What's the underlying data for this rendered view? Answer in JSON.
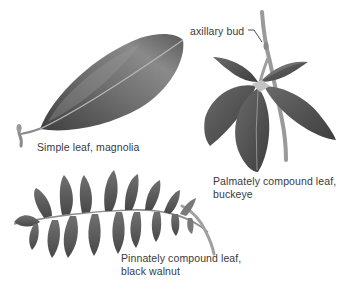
{
  "figure": {
    "background_color": "#ffffff",
    "leaf_color_dark": "#4a4a4a",
    "leaf_color_mid": "#7a7a7a",
    "leaf_color_light": "#a8a8a8",
    "text_color": "#3a3a3a",
    "panels": [
      {
        "id": "magnolia",
        "leaf_type": "simple",
        "caption_line1": "Simple leaf, magnolia"
      },
      {
        "id": "buckeye",
        "leaf_type": "palmately-compound",
        "caption_line1": "Palmately compound leaf,",
        "caption_line2": "buckeye",
        "leaflet_count": 5
      },
      {
        "id": "black-walnut",
        "leaf_type": "pinnately-compound",
        "caption_line1": "Pinnately compound leaf,",
        "caption_line2": "black walnut"
      }
    ],
    "annotations": [
      {
        "label": "axillary bud",
        "points_to": "buckeye-stem"
      }
    ]
  }
}
